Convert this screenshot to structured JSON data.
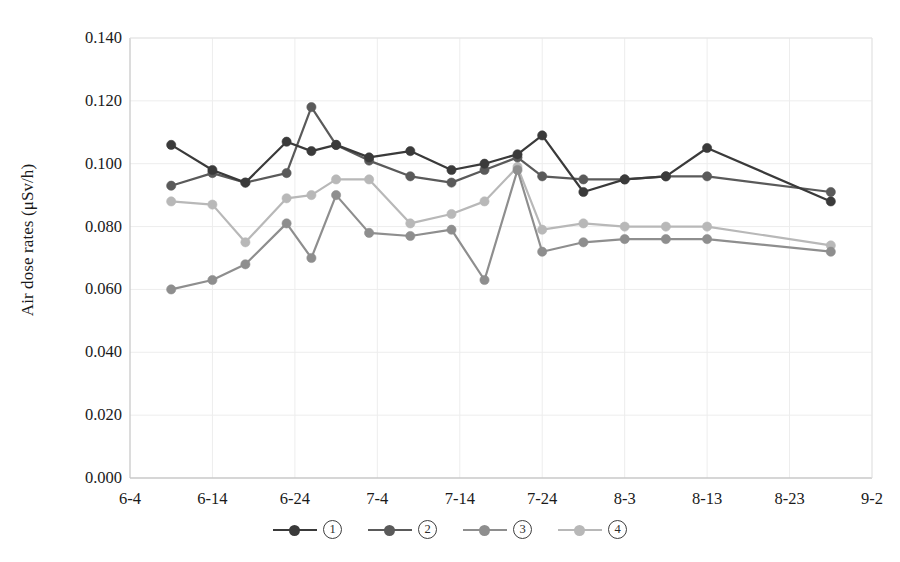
{
  "chart_data": {
    "type": "line",
    "title": "",
    "xlabel": "",
    "ylabel": "Air dose rates (μSv/h)",
    "ylim": [
      0.0,
      0.14
    ],
    "yticks": [
      "0.000",
      "0.020",
      "0.040",
      "0.060",
      "0.080",
      "0.100",
      "0.120",
      "0.140"
    ],
    "ytick_values": [
      0.0,
      0.02,
      0.04,
      0.06,
      0.08,
      0.1,
      0.12,
      0.14
    ],
    "xticks": [
      "6-4",
      "6-14",
      "6-24",
      "7-4",
      "7-14",
      "7-24",
      "8-3",
      "8-13",
      "8-23",
      "9-2"
    ],
    "xtick_values": [
      0,
      10,
      20,
      30,
      40,
      50,
      60,
      70,
      80,
      90
    ],
    "xlim": [
      0,
      90
    ],
    "grid": true,
    "legend_position": "bottom",
    "x": [
      5,
      9,
      14,
      19,
      23,
      26,
      30,
      34,
      39,
      43,
      47,
      50,
      55,
      60,
      65,
      70,
      75,
      85
    ],
    "series": [
      {
        "name": "①",
        "color": "#3a3a3a",
        "x": [
          5,
          10,
          14,
          19,
          22,
          25,
          29,
          34,
          39,
          43,
          47,
          50,
          55,
          60,
          65,
          70,
          85
        ],
        "values": [
          0.106,
          0.098,
          0.094,
          0.107,
          0.104,
          0.106,
          0.102,
          0.104,
          0.098,
          0.1,
          0.103,
          0.109,
          0.091,
          0.095,
          0.096,
          0.105,
          0.088
        ]
      },
      {
        "name": "②",
        "color": "#5a5a5a",
        "x": [
          5,
          10,
          14,
          19,
          22,
          25,
          29,
          34,
          39,
          43,
          47,
          50,
          55,
          60,
          65,
          70,
          85
        ],
        "values": [
          0.093,
          0.097,
          0.094,
          0.097,
          0.118,
          0.106,
          0.101,
          0.096,
          0.094,
          0.098,
          0.102,
          0.096,
          0.095,
          0.095,
          0.096,
          0.096,
          0.091
        ]
      },
      {
        "name": "③",
        "color": "#8e8e8e",
        "x": [
          5,
          10,
          14,
          19,
          22,
          25,
          29,
          34,
          39,
          43,
          47,
          50,
          55,
          60,
          65,
          70,
          85
        ],
        "values": [
          0.06,
          0.063,
          0.068,
          0.081,
          0.07,
          0.09,
          0.078,
          0.077,
          0.079,
          0.063,
          0.098,
          0.072,
          0.075,
          0.076,
          0.076,
          0.076,
          0.072
        ]
      },
      {
        "name": "④",
        "color": "#b8b8b8",
        "x": [
          5,
          10,
          14,
          19,
          22,
          25,
          29,
          34,
          39,
          43,
          47,
          50,
          55,
          60,
          65,
          70,
          85
        ],
        "values": [
          0.088,
          0.087,
          0.075,
          0.089,
          0.09,
          0.095,
          0.095,
          0.081,
          0.084,
          0.088,
          0.099,
          0.079,
          0.081,
          0.08,
          0.08,
          0.08,
          0.074
        ]
      }
    ]
  },
  "axis": {
    "frame_color": "#cfcfcf",
    "grid_color": "#ededed"
  },
  "legend": {
    "items": [
      {
        "label": "①"
      },
      {
        "label": "②"
      },
      {
        "label": "③"
      },
      {
        "label": "④"
      }
    ]
  }
}
